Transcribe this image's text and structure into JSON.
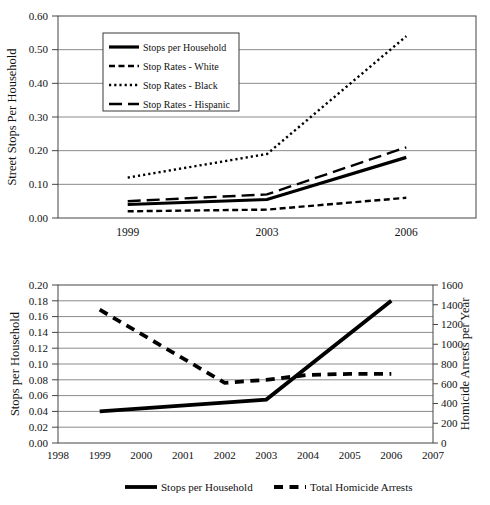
{
  "colors": {
    "line": "#000000",
    "grid": "#8a8a8a",
    "axis_box": "#444444",
    "text": "#111111",
    "background": "#ffffff"
  },
  "chart_data": [
    {
      "type": "line",
      "title": "",
      "ylabel": "Street Stops Per Household",
      "xlabel": "",
      "xticks": [
        "1999",
        "2003",
        "2006"
      ],
      "ylim": [
        0,
        0.6
      ],
      "yticks": [
        "0.00",
        "0.10",
        "0.20",
        "0.30",
        "0.40",
        "0.50",
        "0.60"
      ],
      "grid": true,
      "legend_position": "upper-left-box",
      "series": [
        {
          "name": "Stops per Household",
          "style": "solid",
          "values": [
            0.04,
            0.055,
            0.18
          ]
        },
        {
          "name": "Stop Rates - White",
          "style": "dash-short",
          "values": [
            0.02,
            0.025,
            0.06
          ]
        },
        {
          "name": "Stop Rates - Black",
          "style": "dot",
          "values": [
            0.12,
            0.19,
            0.54
          ]
        },
        {
          "name": "Stop Rates - Hispanic",
          "style": "dash-long",
          "values": [
            0.05,
            0.07,
            0.21
          ]
        }
      ]
    },
    {
      "type": "line",
      "title": "",
      "ylabel_left": "Stops per Household",
      "ylabel_right": "Homicide Arrests per Year",
      "xlabel": "",
      "xlim": [
        1998,
        2007
      ],
      "xticks": [
        "1998",
        "1999",
        "2000",
        "2001",
        "2002",
        "2003",
        "2004",
        "2005",
        "2006",
        "2007"
      ],
      "ylim_left": [
        0,
        0.2
      ],
      "yticks_left": [
        "0.00",
        "0.02",
        "0.04",
        "0.06",
        "0.08",
        "0.10",
        "0.12",
        "0.14",
        "0.16",
        "0.18",
        "0.20"
      ],
      "ylim_right": [
        0,
        1600
      ],
      "yticks_right": [
        "0",
        "200",
        "400",
        "600",
        "800",
        "1000",
        "1200",
        "1400",
        "1600"
      ],
      "grid": true,
      "legend_position": "bottom",
      "series": [
        {
          "name": "Stops per Household",
          "style": "solid-heavy",
          "axis": "left",
          "points": [
            [
              1999,
              0.04
            ],
            [
              2003,
              0.055
            ],
            [
              2006,
              0.18
            ]
          ]
        },
        {
          "name": "Total Homicide Arrests",
          "style": "dash-heavy",
          "axis": "right",
          "points": [
            [
              1999,
              1350
            ],
            [
              2002,
              610
            ],
            [
              2003,
              640
            ],
            [
              2004,
              690
            ],
            [
              2005,
              700
            ],
            [
              2006,
              700
            ]
          ]
        }
      ]
    }
  ]
}
